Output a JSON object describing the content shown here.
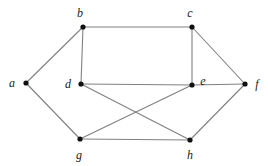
{
  "figure": {
    "kind": "undirected-graph-diagram",
    "background_color": "#ffffff",
    "edge_color": "#808080",
    "vertex_color": "#111111",
    "label_color": "#1a1a1a",
    "width": 268,
    "height": 166
  },
  "graph": {
    "vertex_count": 8,
    "edge_count": 12,
    "vertices": [
      {
        "id": "a",
        "label": "a",
        "x": 26,
        "y": 83,
        "label_x": 12,
        "label_y": 87,
        "label_anchor": "middle"
      },
      {
        "id": "b",
        "label": "b",
        "x": 83,
        "y": 27,
        "label_x": 80,
        "label_y": 17,
        "label_anchor": "middle"
      },
      {
        "id": "c",
        "label": "c",
        "x": 192,
        "y": 27,
        "label_x": 190,
        "label_y": 17,
        "label_anchor": "middle"
      },
      {
        "id": "d",
        "label": "d",
        "x": 81,
        "y": 84,
        "label_x": 68,
        "label_y": 88,
        "label_anchor": "middle"
      },
      {
        "id": "e",
        "label": "e",
        "x": 192,
        "y": 85,
        "label_x": 203,
        "label_y": 85,
        "label_anchor": "middle"
      },
      {
        "id": "f",
        "label": "f",
        "x": 245,
        "y": 84,
        "label_x": 257,
        "label_y": 88,
        "label_anchor": "middle"
      },
      {
        "id": "g",
        "label": "g",
        "x": 80,
        "y": 139,
        "label_x": 79,
        "label_y": 159,
        "label_anchor": "middle"
      },
      {
        "id": "h",
        "label": "h",
        "x": 190,
        "y": 140,
        "label_x": 190,
        "label_y": 159,
        "label_anchor": "middle"
      }
    ],
    "edges": [
      {
        "id": "a-b",
        "from": "a",
        "to": "b"
      },
      {
        "id": "a-g",
        "from": "a",
        "to": "g"
      },
      {
        "id": "b-c",
        "from": "b",
        "to": "c"
      },
      {
        "id": "b-d",
        "from": "b",
        "to": "d"
      },
      {
        "id": "c-e",
        "from": "c",
        "to": "e"
      },
      {
        "id": "c-f",
        "from": "c",
        "to": "f"
      },
      {
        "id": "d-e",
        "from": "d",
        "to": "e"
      },
      {
        "id": "d-h",
        "from": "d",
        "to": "h"
      },
      {
        "id": "e-f",
        "from": "e",
        "to": "f"
      },
      {
        "id": "e-g",
        "from": "e",
        "to": "g"
      },
      {
        "id": "g-h",
        "from": "g",
        "to": "h"
      },
      {
        "id": "h-f",
        "from": "h",
        "to": "f"
      }
    ]
  }
}
